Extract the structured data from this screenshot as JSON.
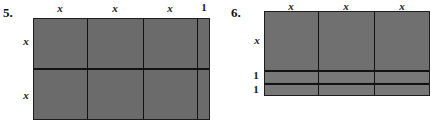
{
  "page": {
    "width": 439,
    "height": 128,
    "background": "#ffffff",
    "tile_fill": "#6e6e6e",
    "line_color": "#121212"
  },
  "problems": [
    {
      "number": "5.",
      "figure": {
        "type": "algebra-tile-rectangle",
        "columns": [
          "x",
          "x",
          "x",
          "1"
        ],
        "rows": [
          "x",
          "x"
        ],
        "top_labels": [
          "x",
          "x",
          "x",
          "1"
        ],
        "left_labels": [
          "x",
          "x"
        ],
        "column_count": 4,
        "row_count": 2,
        "expression": "(x + x + x + 1)(x + x)"
      }
    },
    {
      "number": "6.",
      "figure": {
        "type": "algebra-tile-rectangle",
        "columns": [
          "x",
          "x",
          "x"
        ],
        "rows": [
          "x",
          "1",
          "1"
        ],
        "top_labels": [
          "x",
          "x",
          "x"
        ],
        "left_labels": [
          "x",
          "1",
          "1"
        ],
        "column_count": 3,
        "row_count": 3,
        "expression": "(x + x + x)(x + 1 + 1)"
      }
    }
  ]
}
